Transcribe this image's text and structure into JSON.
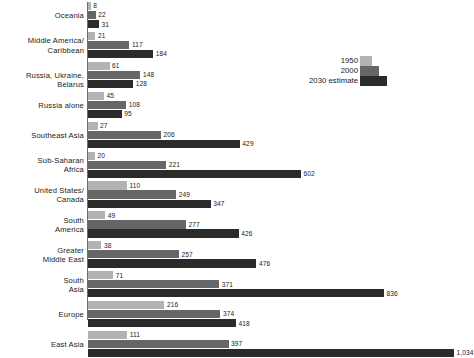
{
  "chart_data": {
    "type": "bar",
    "orientation": "horizontal",
    "title": "",
    "subtitle": "",
    "xlabel": "",
    "ylabel": "",
    "grid": false,
    "legend_position": "upper-right",
    "xlim": [
      0,
      1034
    ],
    "categories": [
      "Oceania",
      "Middle America/\nCaribbean",
      "Russia, Ukraine, Belarus",
      "Russia alone",
      "Southeast Asia",
      "Sub-Saharan\nAfrica",
      "United States/\nCanada",
      "South\nAmerica",
      "Greater\nMiddle East",
      "South\nAsia",
      "Europe",
      "East Asia"
    ],
    "series": [
      {
        "name": "1950",
        "color": "#b3b3b3",
        "values": [
          8,
          21,
          61,
          45,
          27,
          20,
          110,
          49,
          38,
          71,
          216,
          111
        ],
        "labels": [
          "8",
          "21",
          "61",
          "45",
          "27",
          "20",
          "110",
          "49",
          "38",
          "71",
          "216",
          "111"
        ]
      },
      {
        "name": "2000",
        "color": "#666666",
        "values": [
          22,
          117,
          148,
          108,
          206,
          221,
          249,
          277,
          257,
          371,
          374,
          397
        ],
        "labels": [
          "22",
          "117",
          "148",
          "108",
          "206",
          "221",
          "249",
          "277",
          "257",
          "371",
          "374",
          "397"
        ]
      },
      {
        "name": "2030 estimate",
        "color": "#2b2b2b",
        "values": [
          31,
          184,
          128,
          95,
          429,
          602,
          347,
          426,
          476,
          836,
          418,
          1034
        ],
        "labels": [
          "31",
          "184",
          "128",
          "95",
          "429",
          "602",
          "347",
          "426",
          "476",
          "836",
          "418",
          "1,034"
        ]
      }
    ]
  },
  "legend": {
    "items": [
      {
        "label": "1950"
      },
      {
        "label": "2000"
      },
      {
        "label": "2030 estimate"
      }
    ]
  }
}
